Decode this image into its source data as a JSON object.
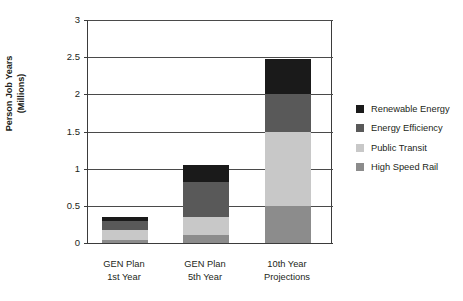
{
  "chart_data": {
    "type": "bar",
    "stacked": true,
    "title": "",
    "xlabel": "",
    "ylabel": "Person Job Years (Millions)",
    "ylabel_lines": [
      "Person Job Years",
      "(Millions)"
    ],
    "ylim": [
      0,
      3
    ],
    "ytick_values": [
      0,
      0.5,
      1,
      1.5,
      2,
      2.5,
      3
    ],
    "ytick_labels": [
      "0",
      "0.5",
      "1",
      "1.5",
      "2",
      "2.5",
      "3"
    ],
    "grid": true,
    "legend_position": "right",
    "categories": [
      "GEN Plan 1st Year",
      "GEN Plan 5th Year",
      "10th Year Projections"
    ],
    "category_label_lines": [
      [
        "GEN Plan",
        "1st Year"
      ],
      [
        "GEN Plan",
        "5th Year"
      ],
      [
        "10th Year",
        "Projections"
      ]
    ],
    "series": [
      {
        "name": "Renewable Energy",
        "color": "#1a1a1a",
        "values": [
          0.06,
          0.23,
          0.47
        ]
      },
      {
        "name": "Energy Efficiency",
        "color": "#595959",
        "values": [
          0.12,
          0.47,
          0.5
        ]
      },
      {
        "name": "Public Transit",
        "color": "#c8c8c8",
        "values": [
          0.13,
          0.24,
          1.0
        ]
      },
      {
        "name": "High Speed Rail",
        "color": "#8c8c8c",
        "values": [
          0.04,
          0.11,
          0.5
        ]
      }
    ],
    "totals": [
      0.35,
      1.05,
      2.47
    ]
  },
  "legend": {
    "items": [
      {
        "label": "Renewable Energy",
        "color": "#1a1a1a"
      },
      {
        "label": "Energy Efficiency",
        "color": "#595959"
      },
      {
        "label": "Public Transit",
        "color": "#c8c8c8"
      },
      {
        "label": "High Speed Rail",
        "color": "#8c8c8c"
      }
    ]
  },
  "colors": {
    "axis": "#3b3b3b",
    "grid": "#4a4a4a",
    "text": "#231f20",
    "background": "#ffffff"
  }
}
